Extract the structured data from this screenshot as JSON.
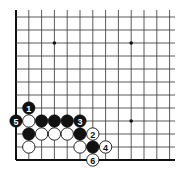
{
  "diagram": {
    "type": "go-board-fragment",
    "corner": "bottom-left",
    "grid": {
      "origin_x": 16,
      "origin_y": 17,
      "spacing_x": 12.8,
      "spacing_y": 13,
      "cols": 13,
      "rows": 12,
      "right_extent": 175,
      "top_extent": 10,
      "line_color": "#333333",
      "edge_color": "#111111"
    },
    "star_points": [
      {
        "col": 3,
        "row": 2
      },
      {
        "col": 9,
        "row": 2
      },
      {
        "col": 9,
        "row": 8
      }
    ],
    "stones": [
      {
        "color": "black",
        "col": 1,
        "row": 7,
        "label": "1"
      },
      {
        "color": "white",
        "col": 6,
        "row": 9,
        "label": "2"
      },
      {
        "color": "black",
        "col": 5,
        "row": 8,
        "label": "3"
      },
      {
        "color": "white",
        "col": 7,
        "row": 10,
        "label": "4"
      },
      {
        "color": "black",
        "col": 0,
        "row": 8,
        "label": "5"
      },
      {
        "color": "white",
        "col": 6,
        "row": 11,
        "label": "6"
      },
      {
        "color": "white",
        "col": 1,
        "row": 8,
        "label": ""
      },
      {
        "color": "black",
        "col": 2,
        "row": 8,
        "label": ""
      },
      {
        "color": "black",
        "col": 3,
        "row": 8,
        "label": ""
      },
      {
        "color": "black",
        "col": 4,
        "row": 8,
        "label": ""
      },
      {
        "color": "black",
        "col": 1,
        "row": 9,
        "label": ""
      },
      {
        "color": "white",
        "col": 2,
        "row": 9,
        "label": ""
      },
      {
        "color": "white",
        "col": 3,
        "row": 9,
        "label": ""
      },
      {
        "color": "white",
        "col": 4,
        "row": 9,
        "label": ""
      },
      {
        "color": "black",
        "col": 5,
        "row": 9,
        "label": ""
      },
      {
        "color": "white",
        "col": 1,
        "row": 10,
        "label": ""
      },
      {
        "color": "white",
        "col": 5,
        "row": 10,
        "label": ""
      },
      {
        "color": "black",
        "col": 6,
        "row": 10,
        "label": ""
      }
    ]
  }
}
